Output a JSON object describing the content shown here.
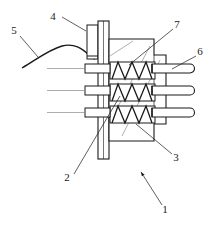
{
  "figure": {
    "type": "patent-line-drawing",
    "title": "",
    "background_color": "#ffffff",
    "line_color": "#1a1a1a",
    "hatch_color": "#555555",
    "width": 216,
    "height": 228
  },
  "callouts": [
    {
      "id": "c4",
      "label": "4",
      "x": 53,
      "y": 17,
      "leader": "horizontal-right-to-connector-block"
    },
    {
      "id": "c5",
      "label": "5",
      "x": 14,
      "y": 31,
      "leader": "diagonal-down-right-to-cable"
    },
    {
      "id": "c7",
      "label": "7",
      "x": 177,
      "y": 25,
      "leader": "diagonal-down-left-to-spring-housing"
    },
    {
      "id": "c6",
      "label": "6",
      "x": 200,
      "y": 52,
      "leader": "diagonal-down-left-to-top-rod"
    },
    {
      "id": "c3",
      "label": "3",
      "x": 176,
      "y": 158,
      "leader": "diagonal-up-left-to-body-step"
    },
    {
      "id": "c2",
      "label": "2",
      "x": 67,
      "y": 178,
      "leader": "diagonal-up-right-to-flange-plate"
    },
    {
      "id": "c1",
      "label": "1",
      "x": 165,
      "y": 210,
      "leader": "diagonal-up-left-arrow-to-assembly"
    }
  ],
  "parts": {
    "flange_plate": {
      "name": "vertical flange plate",
      "callout": "2"
    },
    "connector_block": {
      "name": "upper connector block",
      "callout": "4"
    },
    "cable": {
      "name": "flexible cable",
      "callout": "5"
    },
    "rods": {
      "name": "three parallel rods",
      "callout": "6",
      "count": 3
    },
    "springs": {
      "name": "three compression springs",
      "callout": "7",
      "count": 3,
      "coils_per_spring": 4
    },
    "body": {
      "name": "stepped housing body",
      "callout": "3"
    },
    "assembly": {
      "name": "overall assembly",
      "callout": "1"
    }
  }
}
